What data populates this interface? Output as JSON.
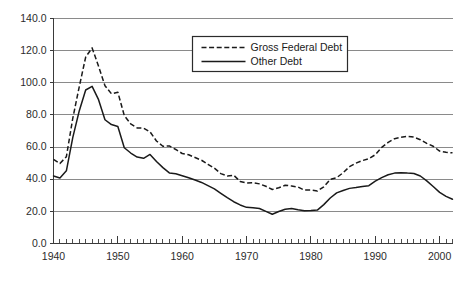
{
  "chart_data": {
    "type": "line",
    "title": "",
    "xlabel": "",
    "ylabel": "",
    "xlim": [
      1940,
      2002
    ],
    "ylim": [
      0,
      140
    ],
    "grid": true,
    "legend_position": "top-center",
    "y_ticks": [
      "0.0",
      "20.0",
      "40.0",
      "60.0",
      "80.0",
      "100.0",
      "120.0",
      "140.0"
    ],
    "y_tick_values": [
      0,
      20,
      40,
      60,
      80,
      100,
      120,
      140
    ],
    "x_ticks": [
      "1940",
      "1950",
      "1960",
      "1970",
      "1980",
      "1990",
      "2000"
    ],
    "x_tick_values": [
      1940,
      1950,
      1960,
      1970,
      1980,
      1990,
      2000
    ],
    "x_minor_tick_step": 1,
    "x": [
      1940,
      1941,
      1942,
      1943,
      1944,
      1945,
      1946,
      1947,
      1948,
      1949,
      1950,
      1951,
      1952,
      1953,
      1954,
      1955,
      1956,
      1957,
      1958,
      1959,
      1960,
      1961,
      1962,
      1963,
      1964,
      1965,
      1966,
      1967,
      1968,
      1969,
      1970,
      1971,
      1972,
      1973,
      1974,
      1975,
      1976,
      1977,
      1978,
      1979,
      1980,
      1981,
      1982,
      1983,
      1984,
      1985,
      1986,
      1987,
      1988,
      1989,
      1990,
      1991,
      1992,
      1993,
      1994,
      1995,
      1996,
      1997,
      1998,
      1999,
      2000,
      2001,
      2002
    ],
    "series": [
      {
        "name": "Gross Federal Debt",
        "style": "dashed",
        "color": "#1a1a1a",
        "values": [
          52.4,
          49.8,
          54.0,
          78.0,
          97.5,
          116.0,
          121.7,
          110.3,
          98.2,
          93.2,
          94.1,
          79.6,
          74.4,
          71.9,
          71.8,
          69.5,
          63.8,
          60.5,
          60.7,
          58.5,
          56.0,
          55.2,
          53.5,
          51.8,
          49.3,
          46.9,
          43.5,
          42.0,
          42.5,
          38.6,
          37.6,
          37.8,
          37.1,
          35.6,
          33.6,
          34.7,
          36.2,
          35.8,
          35.1,
          33.2,
          33.3,
          32.6,
          35.3,
          39.9,
          41.0,
          44.0,
          47.8,
          50.0,
          51.6,
          52.8,
          55.2,
          59.8,
          62.9,
          65.2,
          66.1,
          66.7,
          66.2,
          64.6,
          62.3,
          60.5,
          57.5,
          56.8,
          56.4
        ]
      },
      {
        "name": "Other Debt",
        "style": "solid",
        "color": "#1a1a1a",
        "values": [
          42.0,
          40.8,
          45.2,
          66.0,
          82.5,
          95.5,
          97.8,
          89.5,
          77.0,
          74.0,
          72.8,
          59.6,
          56.3,
          53.8,
          53.0,
          55.4,
          51.0,
          47.2,
          43.9,
          43.4,
          42.2,
          40.9,
          39.5,
          38.0,
          36.0,
          34.0,
          31.2,
          28.5,
          26.0,
          24.0,
          22.5,
          22.3,
          21.8,
          20.0,
          18.2,
          19.9,
          21.3,
          21.8,
          21.0,
          20.4,
          20.5,
          20.8,
          24.2,
          28.3,
          31.5,
          33.0,
          34.3,
          34.8,
          35.4,
          36.0,
          38.8,
          41.0,
          42.8,
          43.8,
          44.1,
          43.8,
          43.6,
          42.0,
          39.0,
          35.5,
          31.8,
          29.3,
          27.5
        ]
      }
    ],
    "legend": [
      {
        "label": "Gross Federal Debt",
        "style": "dashed"
      },
      {
        "label": "Other Debt",
        "style": "solid"
      }
    ]
  }
}
